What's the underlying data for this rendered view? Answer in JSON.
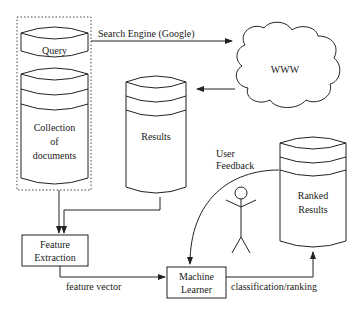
{
  "diagram": {
    "nodes": {
      "query": {
        "label": "Query",
        "shape": "cylinder-segment"
      },
      "collection": {
        "label_lines": [
          "Collection",
          "of",
          "documents"
        ],
        "shape": "cylinder"
      },
      "www": {
        "label": "WWW",
        "shape": "cloud"
      },
      "results": {
        "label": "Results",
        "shape": "cylinder"
      },
      "ranked_results": {
        "label_lines": [
          "Ranked",
          "Results"
        ],
        "shape": "cylinder"
      },
      "feature_extraction": {
        "label_lines": [
          "Feature",
          "Extraction"
        ],
        "shape": "box"
      },
      "machine_learner": {
        "label_lines": [
          "Machine",
          "Learner"
        ],
        "shape": "box"
      },
      "user": {
        "label": "user-stick-figure",
        "shape": "stick-figure"
      }
    },
    "edges": {
      "search_engine": {
        "from": "query",
        "to": "www",
        "label": "Search Engine (Google)"
      },
      "www_to_results": {
        "from": "www",
        "to": "results",
        "label": ""
      },
      "collection_to_fe": {
        "from": "collection",
        "to": "feature_extraction",
        "label": ""
      },
      "results_to_fe": {
        "from": "results",
        "to": "feature_extraction",
        "label": ""
      },
      "feature_vector": {
        "from": "feature_extraction",
        "to": "machine_learner",
        "label": "feature vector"
      },
      "classification": {
        "from": "machine_learner",
        "to": "ranked_results",
        "label": "classification/ranking"
      },
      "user_feedback": {
        "from": "ranked_results",
        "to": "machine_learner",
        "label_lines": [
          "User",
          "Feedback"
        ]
      }
    },
    "group": {
      "members": [
        "query",
        "collection"
      ],
      "border": "dotted"
    },
    "colors": {
      "line": "#222222",
      "background": "#ffffff"
    }
  }
}
